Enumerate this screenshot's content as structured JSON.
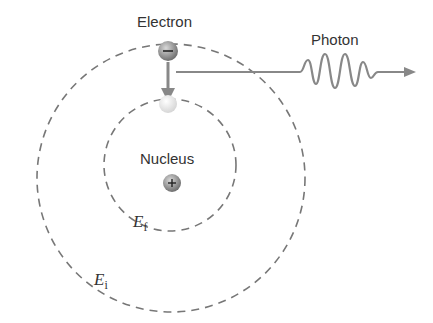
{
  "diagram": {
    "labels": {
      "electron": "Electron",
      "photon": "Photon",
      "nucleus": "Nucleus",
      "initial_energy": {
        "symbol": "E",
        "subscript": "i"
      },
      "final_energy": {
        "symbol": "E",
        "subscript": "f"
      }
    },
    "charges": {
      "electron": "−",
      "nucleus": "+"
    },
    "colors": {
      "orbit": "#777777",
      "arrow": "#888888",
      "text": "#333333"
    }
  }
}
